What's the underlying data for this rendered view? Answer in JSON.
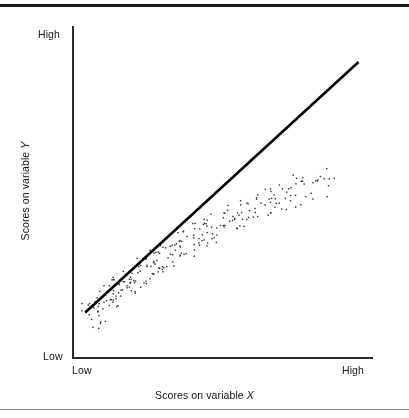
{
  "figure": {
    "background_color": "#ffffff",
    "rule_color_top": "#1a1a1a",
    "rule_color_bottom": "#8d8d8d"
  },
  "axes": {
    "line_color": "#2b2b2b",
    "y_axis_top_label": "High",
    "y_axis_bottom_label": "Low",
    "x_axis_left_label": "Low",
    "x_axis_right_label": "High",
    "x_title_prefix": "Scores on variable ",
    "x_title_variable": "X",
    "y_title_prefix": "Scores on variable ",
    "y_title_variable": "Y"
  },
  "chart_data": {
    "type": "scatter",
    "title": "",
    "subtitle": "",
    "xlabel": "Scores on variable X",
    "ylabel": "Scores on variable Y",
    "xlim": [
      0,
      1
    ],
    "ylim": [
      0,
      1
    ],
    "xtick_labels": [
      "Low",
      "High"
    ],
    "ytick_labels": [
      "Low",
      "High"
    ],
    "xticks": [
      0,
      1
    ],
    "yticks": [
      0,
      1
    ],
    "grid": false,
    "legend": false,
    "legend_position": "none",
    "annotations": [],
    "point_color": "#2e2e2e",
    "point_size_px": 1.4,
    "point_count": 252,
    "trendline": {
      "visible": true,
      "color": "#000000",
      "width_px": 2.6,
      "x0": 0.041,
      "y0": 0.135,
      "x1": 0.955,
      "y1": 0.894
    },
    "series": [
      {
        "name": "observations",
        "x": [
          0.043,
          0.048,
          0.052,
          0.055,
          0.058,
          0.061,
          0.063,
          0.066,
          0.068,
          0.07,
          0.072,
          0.074,
          0.077,
          0.079,
          0.081,
          0.083,
          0.086,
          0.088,
          0.09,
          0.093,
          0.095,
          0.097,
          0.1,
          0.102,
          0.104,
          0.107,
          0.109,
          0.111,
          0.114,
          0.116,
          0.118,
          0.121,
          0.123,
          0.126,
          0.128,
          0.13,
          0.133,
          0.135,
          0.137,
          0.14,
          0.142,
          0.145,
          0.147,
          0.149,
          0.152,
          0.154,
          0.157,
          0.159,
          0.161,
          0.164,
          0.166,
          0.169,
          0.171,
          0.173,
          0.176,
          0.178,
          0.181,
          0.183,
          0.185,
          0.188,
          0.19,
          0.193,
          0.195,
          0.198,
          0.2,
          0.203,
          0.205,
          0.208,
          0.21,
          0.213,
          0.215,
          0.218,
          0.22,
          0.223,
          0.225,
          0.228,
          0.23,
          0.233,
          0.236,
          0.238,
          0.241,
          0.243,
          0.246,
          0.248,
          0.251,
          0.254,
          0.256,
          0.259,
          0.261,
          0.264,
          0.267,
          0.269,
          0.272,
          0.275,
          0.277,
          0.28,
          0.283,
          0.285,
          0.288,
          0.291,
          0.293,
          0.296,
          0.299,
          0.301,
          0.304,
          0.307,
          0.31,
          0.312,
          0.315,
          0.318,
          0.321,
          0.323,
          0.326,
          0.329,
          0.332,
          0.335,
          0.337,
          0.34,
          0.343,
          0.346,
          0.349,
          0.352,
          0.355,
          0.357,
          0.36,
          0.363,
          0.366,
          0.369,
          0.372,
          0.375,
          0.378,
          0.381,
          0.384,
          0.387,
          0.39,
          0.393,
          0.396,
          0.399,
          0.402,
          0.405,
          0.408,
          0.411,
          0.414,
          0.417,
          0.421,
          0.424,
          0.427,
          0.43,
          0.433,
          0.436,
          0.439,
          0.443,
          0.446,
          0.449,
          0.452,
          0.455,
          0.459,
          0.462,
          0.465,
          0.468,
          0.472,
          0.475,
          0.478,
          0.482,
          0.485,
          0.488,
          0.492,
          0.495,
          0.498,
          0.502,
          0.505,
          0.509,
          0.512,
          0.516,
          0.519,
          0.523,
          0.526,
          0.53,
          0.533,
          0.537,
          0.54,
          0.544,
          0.547,
          0.551,
          0.555,
          0.558,
          0.562,
          0.566,
          0.569,
          0.573,
          0.577,
          0.58,
          0.584,
          0.588,
          0.592,
          0.596,
          0.599,
          0.603,
          0.607,
          0.611,
          0.615,
          0.619,
          0.623,
          0.627,
          0.631,
          0.635,
          0.639,
          0.643,
          0.647,
          0.651,
          0.656,
          0.66,
          0.664,
          0.668,
          0.673,
          0.677,
          0.681,
          0.686,
          0.69,
          0.695,
          0.699,
          0.704,
          0.708,
          0.713,
          0.717,
          0.722,
          0.727,
          0.731,
          0.736,
          0.741,
          0.746,
          0.751,
          0.756,
          0.761,
          0.766,
          0.771,
          0.776,
          0.781,
          0.786,
          0.792,
          0.797,
          0.802,
          0.808,
          0.813,
          0.819,
          0.824,
          0.83,
          0.836,
          0.841,
          0.847,
          0.853,
          0.859
        ],
        "y": [
          0.118,
          0.152,
          0.107,
          0.168,
          0.131,
          0.098,
          0.176,
          0.142,
          0.113,
          0.185,
          0.126,
          0.159,
          0.104,
          0.193,
          0.147,
          0.121,
          0.172,
          0.138,
          0.201,
          0.155,
          0.128,
          0.187,
          0.164,
          0.134,
          0.209,
          0.171,
          0.145,
          0.196,
          0.158,
          0.217,
          0.181,
          0.152,
          0.204,
          0.168,
          0.225,
          0.191,
          0.161,
          0.213,
          0.178,
          0.233,
          0.199,
          0.171,
          0.221,
          0.188,
          0.241,
          0.207,
          0.179,
          0.229,
          0.196,
          0.249,
          0.215,
          0.187,
          0.237,
          0.204,
          0.257,
          0.223,
          0.195,
          0.245,
          0.212,
          0.265,
          0.231,
          0.203,
          0.253,
          0.22,
          0.273,
          0.239,
          0.211,
          0.261,
          0.228,
          0.281,
          0.247,
          0.219,
          0.269,
          0.236,
          0.289,
          0.255,
          0.227,
          0.277,
          0.244,
          0.297,
          0.263,
          0.235,
          0.285,
          0.252,
          0.305,
          0.271,
          0.243,
          0.293,
          0.26,
          0.313,
          0.279,
          0.251,
          0.301,
          0.268,
          0.321,
          0.287,
          0.259,
          0.309,
          0.276,
          0.329,
          0.295,
          0.267,
          0.317,
          0.284,
          0.337,
          0.303,
          0.275,
          0.325,
          0.292,
          0.345,
          0.311,
          0.283,
          0.333,
          0.3,
          0.353,
          0.319,
          0.291,
          0.341,
          0.308,
          0.361,
          0.327,
          0.299,
          0.349,
          0.316,
          0.369,
          0.335,
          0.307,
          0.357,
          0.324,
          0.377,
          0.343,
          0.315,
          0.365,
          0.332,
          0.385,
          0.351,
          0.323,
          0.373,
          0.34,
          0.393,
          0.359,
          0.331,
          0.381,
          0.348,
          0.401,
          0.367,
          0.339,
          0.389,
          0.356,
          0.409,
          0.375,
          0.347,
          0.397,
          0.364,
          0.417,
          0.383,
          0.355,
          0.405,
          0.372,
          0.425,
          0.391,
          0.363,
          0.413,
          0.38,
          0.433,
          0.399,
          0.371,
          0.421,
          0.388,
          0.441,
          0.407,
          0.379,
          0.429,
          0.396,
          0.449,
          0.415,
          0.387,
          0.437,
          0.404,
          0.457,
          0.423,
          0.395,
          0.445,
          0.412,
          0.465,
          0.431,
          0.403,
          0.453,
          0.42,
          0.473,
          0.439,
          0.411,
          0.461,
          0.428,
          0.481,
          0.447,
          0.419,
          0.469,
          0.436,
          0.489,
          0.455,
          0.427,
          0.477,
          0.444,
          0.497,
          0.463,
          0.435,
          0.485,
          0.452,
          0.505,
          0.471,
          0.443,
          0.493,
          0.46,
          0.513,
          0.479,
          0.451,
          0.501,
          0.468,
          0.521,
          0.487,
          0.459,
          0.509,
          0.476,
          0.529,
          0.495,
          0.467,
          0.517,
          0.484,
          0.537,
          0.503,
          0.475,
          0.525,
          0.492,
          0.545,
          0.511,
          0.483,
          0.533,
          0.5,
          0.553,
          0.519,
          0.491,
          0.541,
          0.508,
          0.561,
          0.527,
          0.499,
          0.549,
          0.516,
          0.569,
          0.535,
          0.507
        ]
      }
    ]
  }
}
